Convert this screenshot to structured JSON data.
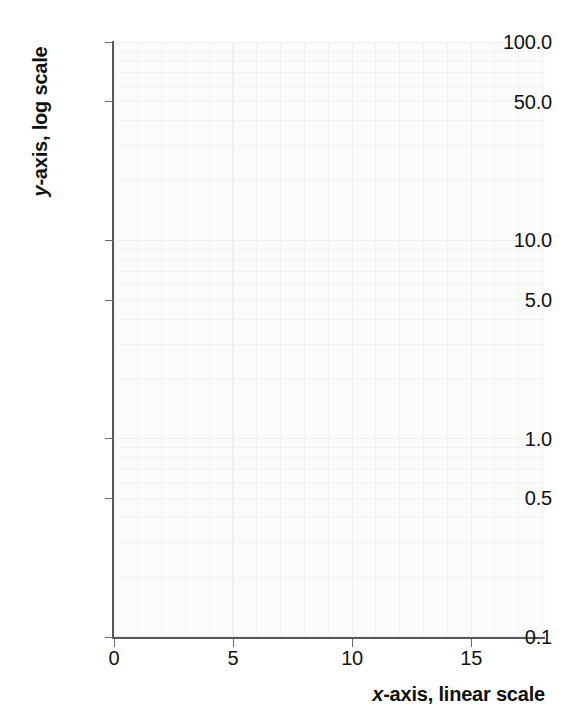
{
  "chart_data": {
    "type": "line",
    "title": "",
    "subtitle": "",
    "xlabel_prefix": "x",
    "xlabel_rest": "-axis, linear scale",
    "ylabel_prefix": "y",
    "ylabel_rest": "-axis, log scale",
    "xscale": "linear",
    "yscale": "log",
    "xlim": [
      0,
      18.1
    ],
    "ylim": [
      0.1,
      100
    ],
    "x_ticks": [
      {
        "value": 0,
        "label": "0"
      },
      {
        "value": 5,
        "label": "5"
      },
      {
        "value": 10,
        "label": "10"
      },
      {
        "value": 15,
        "label": "15"
      }
    ],
    "y_ticks": [
      {
        "value": 100,
        "label": "100.0"
      },
      {
        "value": 50,
        "label": "50.0"
      },
      {
        "value": 10,
        "label": "10.0"
      },
      {
        "value": 5,
        "label": "5.0"
      },
      {
        "value": 1,
        "label": "1.0"
      },
      {
        "value": 0.5,
        "label": "0.5"
      },
      {
        "value": 0.1,
        "label": "0.1"
      }
    ],
    "series": [],
    "grid": {
      "visible": true,
      "x_minor_step": 1,
      "y_minor": "log-decade-subdivisions-1-to-9",
      "color": "#efefef"
    },
    "legend": {
      "visible": false,
      "entries": []
    },
    "annotations": [],
    "colors": {
      "plot_background": "#fbfbfb",
      "grid_line": "#efefef",
      "axis_line": "#575757",
      "tick_mark": "#6b6b6b",
      "text": "#111111",
      "page_background": "#ffffff"
    }
  }
}
